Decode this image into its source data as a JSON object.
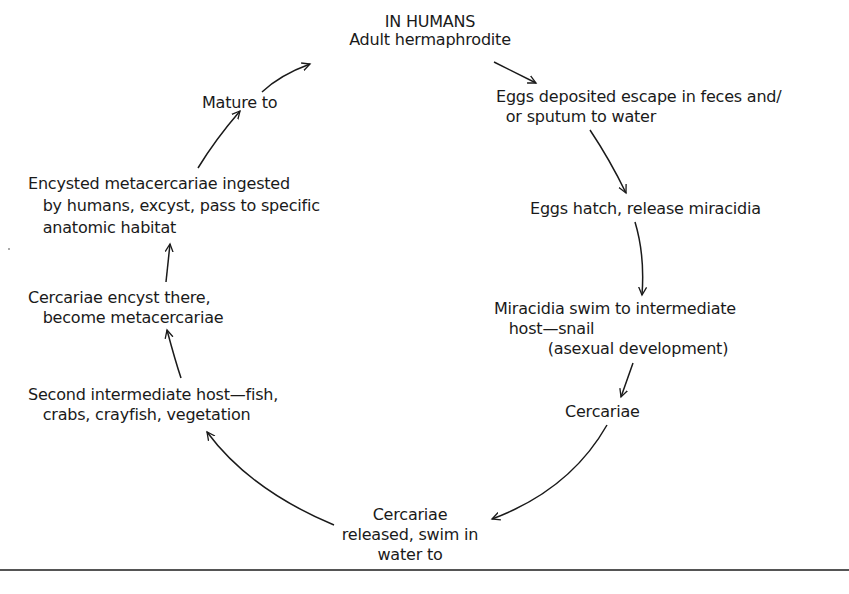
{
  "diagram": {
    "title": "IN HUMANS",
    "nodes": [
      {
        "id": "adult",
        "lines": [
          "IN HUMANS",
          "Adult hermaphrodite"
        ]
      },
      {
        "id": "eggs-deposited",
        "lines": [
          "Eggs deposited escape in feces and/",
          "  or sputum to water"
        ]
      },
      {
        "id": "eggs-hatch",
        "lines": [
          "Eggs hatch, release miracidia"
        ]
      },
      {
        "id": "miracidia",
        "lines": [
          "Miracidia swim to intermediate",
          "   host—snail",
          "           (asexual development)"
        ]
      },
      {
        "id": "cercariae",
        "lines": [
          "Cercariae"
        ]
      },
      {
        "id": "cercariae-released",
        "lines": [
          "Cercariae",
          "released, swim in",
          "water to"
        ]
      },
      {
        "id": "second-host",
        "lines": [
          "Second intermediate host—fish,",
          "   crabs, crayfish, vegetation"
        ]
      },
      {
        "id": "encyst",
        "lines": [
          "Cercariae encyst there,",
          "   become metacercariae"
        ]
      },
      {
        "id": "ingested",
        "lines": [
          "Encysted metacercariae ingested",
          "   by humans, excyst, pass to specific",
          "   anatomic habitat"
        ]
      },
      {
        "id": "mature",
        "lines": [
          "Mature to"
        ]
      }
    ],
    "edges": [
      {
        "from": "adult",
        "to": "eggs-deposited"
      },
      {
        "from": "eggs-deposited",
        "to": "eggs-hatch"
      },
      {
        "from": "eggs-hatch",
        "to": "miracidia"
      },
      {
        "from": "miracidia",
        "to": "cercariae"
      },
      {
        "from": "cercariae",
        "to": "cercariae-released"
      },
      {
        "from": "cercariae-released",
        "to": "second-host"
      },
      {
        "from": "second-host",
        "to": "encyst"
      },
      {
        "from": "encyst",
        "to": "ingested"
      },
      {
        "from": "ingested",
        "to": "mature"
      },
      {
        "from": "mature",
        "to": "adult"
      }
    ],
    "colors": {
      "ink": "#1a1a1a",
      "background": "#ffffff",
      "rule": "#555555"
    }
  }
}
